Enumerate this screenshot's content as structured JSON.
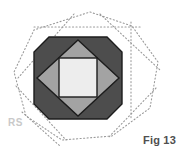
{
  "figure": {
    "caption": "Fig 13",
    "watermark": "RS",
    "canvas": {
      "width": 182,
      "height": 153,
      "background": "#ffffff"
    },
    "palette": {
      "outline": "#1c1c1c",
      "dark_gray_fill": "#4d4d4d",
      "medium_gray_fill": "#a3a3a3",
      "light_fill": "#ededed",
      "construction_line": "#9a9a9a",
      "caption_text": "#4f4f4f",
      "watermark_text": "#c9c9c9"
    },
    "shapes": {
      "outer_construction_octagon": {
        "name": "dotted construction octagon",
        "style": "dotted",
        "points": "90,12 132,26 158,62 150,108 112,136 62,140 26,116 14,72 34,30"
      },
      "construction_horizontal_line": {
        "name": "dotted horizontal guide",
        "style": "dotted",
        "x1": 34,
        "y1": 27,
        "x2": 142,
        "y2": 27
      },
      "construction_vertical_line": {
        "name": "dotted vertical guide",
        "style": "dotted",
        "x1": 131,
        "y1": 22,
        "x2": 131,
        "y2": 120
      },
      "construction_diagonals": [
        {
          "name": "diagonal upper-left",
          "x1": 18,
          "y1": 78,
          "x2": 74,
          "y2": 14
        },
        {
          "name": "diagonal upper-right",
          "x1": 100,
          "y1": 14,
          "x2": 160,
          "y2": 70
        },
        {
          "name": "diagonal lower-left",
          "x1": 16,
          "y1": 86,
          "x2": 66,
          "y2": 140
        },
        {
          "name": "diagonal lower-right",
          "x1": 156,
          "y1": 88,
          "x2": 108,
          "y2": 138
        },
        {
          "name": "diagonal watermark sweep",
          "x1": 22,
          "y1": 112,
          "x2": 60,
          "y2": 146
        }
      ],
      "main_octagon": {
        "name": "dark gray octagon body",
        "fill": "#4d4d4d",
        "points": "49,37 107,37 122,52 122,104 107,119 49,119 34,104 34,52"
      },
      "inner_diamond": {
        "name": "medium gray rotated square",
        "fill": "#a3a3a3",
        "points": "78,40 119,78 78,116 37,78"
      },
      "center_square": {
        "name": "light center square",
        "fill": "#ededed",
        "x": 59,
        "y": 58,
        "width": 38,
        "height": 39
      },
      "diamond_corner_chords": [
        {
          "name": "chord top-left",
          "x1": 37,
          "y1": 78,
          "x2": 78,
          "y2": 40
        },
        {
          "name": "chord top-right",
          "x1": 78,
          "y1": 40,
          "x2": 119,
          "y2": 78
        },
        {
          "name": "chord bottom-right",
          "x1": 119,
          "y1": 78,
          "x2": 78,
          "y2": 116
        },
        {
          "name": "chord bottom-left",
          "x1": 78,
          "y1": 116,
          "x2": 37,
          "y2": 78
        }
      ]
    }
  }
}
